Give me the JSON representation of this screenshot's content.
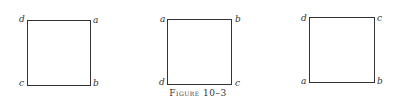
{
  "figure": {
    "caption": "Figure 10–3",
    "squares": [
      {
        "top_left": "d",
        "top_right": "a",
        "bottom_left": "c",
        "bottom_right": "b"
      },
      {
        "top_left": "a",
        "top_right": "b",
        "bottom_left": "d",
        "bottom_right": "c"
      },
      {
        "top_left": "d",
        "top_right": "c",
        "bottom_left": "a",
        "bottom_right": "b"
      }
    ]
  }
}
